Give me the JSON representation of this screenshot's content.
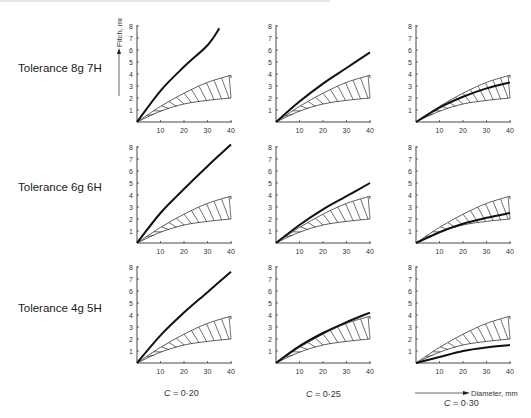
{
  "rows": [
    {
      "label": "Tolerance 8g 7H"
    },
    {
      "label": "Tolerance 6g 6H"
    },
    {
      "label": "Tolerance 4g 5H"
    }
  ],
  "columns": [
    {
      "c_symbol": "C",
      "c_label": " =  0·20"
    },
    {
      "c_symbol": "C",
      "c_label": " =  0·25"
    },
    {
      "c_symbol": "C",
      "c_label": " =  0·30"
    }
  ],
  "axes": {
    "ylabel": "Pitch, mm",
    "xlabel": "Diameter, mm",
    "yticks": [
      1,
      2,
      3,
      4,
      5,
      6,
      7,
      8
    ],
    "xticks": [
      10,
      20,
      30,
      40
    ],
    "xlim": [
      0,
      40
    ],
    "ylim": [
      0,
      8
    ]
  },
  "colors": {
    "curve": "#111111",
    "band": "#333333",
    "axis": "#333333",
    "text": "#333333"
  },
  "chart_data": {
    "type": "line",
    "title": "",
    "xlabel": "Diameter, mm",
    "ylabel": "Pitch, mm",
    "xlim": [
      0,
      40
    ],
    "ylim": [
      0,
      8
    ],
    "grid": false,
    "band": {
      "name": "standard pitch range (hatched)",
      "x": [
        0,
        10,
        20,
        30,
        40
      ],
      "upper": [
        0,
        1.3,
        2.4,
        3.3,
        3.9
      ],
      "lower": [
        0,
        0.9,
        1.5,
        1.8,
        2.0
      ]
    },
    "panels": [
      {
        "row": "Tolerance 8g 7H",
        "column": "C = 0·20",
        "x": [
          0,
          10,
          20,
          30,
          35
        ],
        "y": [
          0,
          2.6,
          4.6,
          6.4,
          7.8
        ]
      },
      {
        "row": "Tolerance 8g 7H",
        "column": "C = 0·25",
        "x": [
          0,
          10,
          20,
          30,
          40
        ],
        "y": [
          0,
          1.7,
          3.2,
          4.5,
          5.8
        ]
      },
      {
        "row": "Tolerance 8g 7H",
        "column": "C = 0·30",
        "x": [
          0,
          10,
          20,
          30,
          40
        ],
        "y": [
          0,
          1.2,
          2.1,
          2.8,
          3.3
        ]
      },
      {
        "row": "Tolerance 6g 6H",
        "column": "C = 0·20",
        "x": [
          0,
          10,
          20,
          30,
          40
        ],
        "y": [
          0,
          2.5,
          4.5,
          6.4,
          8.2
        ]
      },
      {
        "row": "Tolerance 6g 6H",
        "column": "C = 0·25",
        "x": [
          0,
          10,
          20,
          30,
          40
        ],
        "y": [
          0,
          1.5,
          2.8,
          3.9,
          5.0
        ]
      },
      {
        "row": "Tolerance 6g 6H",
        "column": "C = 0·30",
        "x": [
          0,
          10,
          20,
          30,
          40
        ],
        "y": [
          0,
          0.9,
          1.6,
          2.1,
          2.5
        ]
      },
      {
        "row": "Tolerance 4g 5H",
        "column": "C = 0·20",
        "x": [
          0,
          10,
          20,
          30,
          40
        ],
        "y": [
          0,
          2.3,
          4.2,
          5.9,
          7.6
        ]
      },
      {
        "row": "Tolerance 4g 5H",
        "column": "C = 0·25",
        "x": [
          0,
          10,
          20,
          30,
          40
        ],
        "y": [
          0,
          1.4,
          2.5,
          3.4,
          4.2
        ]
      },
      {
        "row": "Tolerance 4g 5H",
        "column": "C = 0·30",
        "x": [
          0,
          10,
          20,
          30,
          40
        ],
        "y": [
          0,
          0.5,
          1.0,
          1.3,
          1.5
        ]
      }
    ]
  }
}
